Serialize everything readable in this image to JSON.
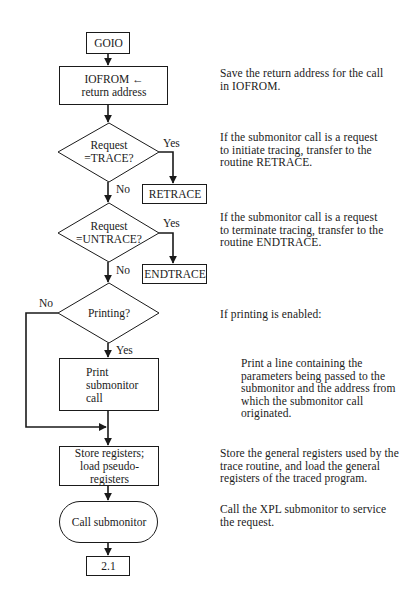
{
  "diagram": {
    "type": "flowchart",
    "nodes": [
      {
        "id": "goio",
        "shape": "rect",
        "label": "GOIO"
      },
      {
        "id": "iofrom",
        "shape": "rect",
        "label": "IOFROM ←\nreturn address"
      },
      {
        "id": "dec_trace",
        "shape": "diamond",
        "label": "Request\n=TRACE?"
      },
      {
        "id": "retrace",
        "shape": "rect",
        "label": "RETRACE"
      },
      {
        "id": "dec_untrace",
        "shape": "diamond",
        "label": "Request\n=UNTRACE?"
      },
      {
        "id": "endtrace",
        "shape": "rect",
        "label": "ENDTRACE"
      },
      {
        "id": "dec_printing",
        "shape": "diamond",
        "label": "Printing?"
      },
      {
        "id": "print_call",
        "shape": "rect",
        "label": "Print\nsubmonitor\ncall"
      },
      {
        "id": "store_regs",
        "shape": "rect",
        "label": "Store registers;\nload pseudo-\nregisters"
      },
      {
        "id": "call_submonitor",
        "shape": "terminator",
        "label": "Call submonitor"
      },
      {
        "id": "connector_2_1",
        "shape": "rect",
        "label": "2.1"
      }
    ],
    "edges": [
      {
        "from": "goio",
        "to": "iofrom",
        "label": ""
      },
      {
        "from": "iofrom",
        "to": "dec_trace",
        "label": ""
      },
      {
        "from": "dec_trace",
        "to": "retrace",
        "label": "Yes"
      },
      {
        "from": "dec_trace",
        "to": "dec_untrace",
        "label": "No"
      },
      {
        "from": "dec_untrace",
        "to": "endtrace",
        "label": "Yes"
      },
      {
        "from": "dec_untrace",
        "to": "dec_printing",
        "label": "No"
      },
      {
        "from": "dec_printing",
        "to": "print_call",
        "label": "Yes"
      },
      {
        "from": "dec_printing",
        "to": "store_regs",
        "label": "No"
      },
      {
        "from": "print_call",
        "to": "store_regs",
        "label": ""
      },
      {
        "from": "store_regs",
        "to": "call_submonitor",
        "label": ""
      },
      {
        "from": "call_submonitor",
        "to": "connector_2_1",
        "label": ""
      }
    ],
    "edge_labels": {
      "trace_yes": "Yes",
      "trace_no": "No",
      "untrace_yes": "Yes",
      "untrace_no": "No",
      "printing_no": "No",
      "printing_yes": "Yes"
    }
  },
  "annotations": {
    "iofrom": "Save the return address for the call\nin IOFROM.",
    "trace": "If the submonitor call is a request\nto initiate tracing, transfer to the\nroutine RETRACE.",
    "untrace": "If the submonitor call is a request\nto terminate tracing, transfer to the\nroutine ENDTRACE.",
    "printing": "If printing is enabled:",
    "print_call": "Print a line containing the\nparameters being passed to the\nsubmonitor and the address from\nwhich the submonitor call\noriginated.",
    "store_regs": "Store the general registers used by the\ntrace routine, and load the general\nregisters of the traced program.",
    "call_submonitor": "Call the XPL submonitor to service\nthe request."
  },
  "colors": {
    "line": "#1a1a1a",
    "background": "#ffffff"
  }
}
